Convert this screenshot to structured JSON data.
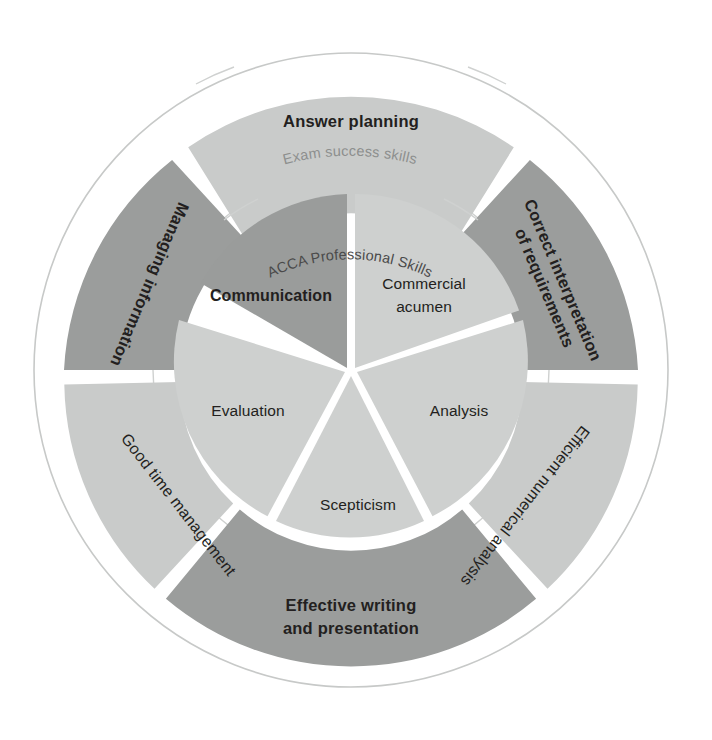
{
  "diagram": {
    "title_outer_ring": "Exam success skills",
    "title_inner_ring": "ACCA Professional Skills",
    "colors": {
      "segment_dark": "#9b9d9c",
      "segment_light": "#c9cbca",
      "inner_dark": "#9a9c9b",
      "inner_light": "#ced0cf",
      "label_text": "#231f20",
      "background": "#ffffff"
    },
    "outer_ring": {
      "label": "Exam success skills",
      "segments": [
        {
          "label": "Answer planning",
          "label_line1": "Answer planning",
          "label_line2": "",
          "tone": "light",
          "emphasis": "bold"
        },
        {
          "label": "Correct interpretation of requirements",
          "label_line1": "Correct interpretation",
          "label_line2": "of requirements",
          "tone": "dark",
          "emphasis": "bold"
        },
        {
          "label": "Efficient numerical analysis",
          "label_line1": "Efficient numerical analysis",
          "label_line2": "",
          "tone": "light",
          "emphasis": "regular"
        },
        {
          "label": "Effective writing and presentation",
          "label_line1": "Effective writing",
          "label_line2": "and presentation",
          "tone": "dark",
          "emphasis": "bold"
        },
        {
          "label": "Good time management",
          "label_line1": "Good time management",
          "label_line2": "",
          "tone": "light",
          "emphasis": "regular"
        },
        {
          "label": "Managing information",
          "label_line1": "Managing information",
          "label_line2": "",
          "tone": "dark",
          "emphasis": "bold"
        }
      ]
    },
    "inner_ring": {
      "label": "ACCA Professional Skills",
      "segments": [
        {
          "label": "Communication",
          "label_line1": "Communication",
          "label_line2": "",
          "tone": "dark",
          "emphasis": "bold"
        },
        {
          "label": "Commercial acumen",
          "label_line1": "Commercial",
          "label_line2": "acumen",
          "tone": "light",
          "emphasis": "regular"
        },
        {
          "label": "Analysis",
          "label_line1": "Analysis",
          "label_line2": "",
          "tone": "light",
          "emphasis": "regular"
        },
        {
          "label": "Scepticism",
          "label_line1": "Scepticism",
          "label_line2": "",
          "tone": "light",
          "emphasis": "regular"
        },
        {
          "label": "Evaluation",
          "label_line1": "Evaluation",
          "label_line2": "",
          "tone": "light",
          "emphasis": "regular"
        }
      ]
    }
  }
}
